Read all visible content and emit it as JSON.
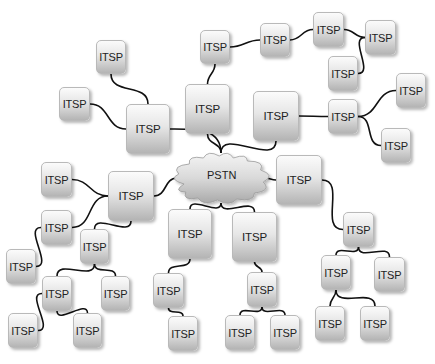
{
  "diagram": {
    "title": "",
    "center": {
      "id": "pstn",
      "label": "PSTN",
      "x": 177,
      "y": 153,
      "w": 88,
      "h": 50
    },
    "nodes": [
      {
        "id": "n1",
        "label": "ITSP",
        "x": 96,
        "y": 40,
        "w": 30,
        "h": 34
      },
      {
        "id": "n2",
        "label": "ITSP",
        "x": 59,
        "y": 87,
        "w": 31,
        "h": 34
      },
      {
        "id": "n3",
        "label": "ITSP",
        "x": 126,
        "y": 104,
        "w": 44,
        "h": 50,
        "size": "large"
      },
      {
        "id": "n4",
        "label": "ITSP",
        "x": 185,
        "y": 84,
        "w": 45,
        "h": 50,
        "size": "large"
      },
      {
        "id": "n5",
        "label": "ITSP",
        "x": 200,
        "y": 30,
        "w": 30,
        "h": 34
      },
      {
        "id": "n6",
        "label": "ITSP",
        "x": 260,
        "y": 23,
        "w": 30,
        "h": 34
      },
      {
        "id": "n7",
        "label": "ITSP",
        "x": 313,
        "y": 12,
        "w": 31,
        "h": 35
      },
      {
        "id": "n8",
        "label": "ITSP",
        "x": 365,
        "y": 20,
        "w": 31,
        "h": 35
      },
      {
        "id": "n9",
        "label": "ITSP",
        "x": 328,
        "y": 56,
        "w": 30,
        "h": 35
      },
      {
        "id": "n10",
        "label": "ITSP",
        "x": 253,
        "y": 91,
        "w": 46,
        "h": 50,
        "size": "large"
      },
      {
        "id": "n11",
        "label": "ITSP",
        "x": 328,
        "y": 99,
        "w": 30,
        "h": 35
      },
      {
        "id": "n12",
        "label": "ITSP",
        "x": 396,
        "y": 73,
        "w": 30,
        "h": 35
      },
      {
        "id": "n13",
        "label": "ITSP",
        "x": 381,
        "y": 128,
        "w": 30,
        "h": 35
      },
      {
        "id": "n14",
        "label": "ITSP",
        "x": 276,
        "y": 155,
        "w": 46,
        "h": 50,
        "size": "large"
      },
      {
        "id": "n15",
        "label": "ITSP",
        "x": 343,
        "y": 212,
        "w": 31,
        "h": 35
      },
      {
        "id": "n16",
        "label": "ITSP",
        "x": 321,
        "y": 255,
        "w": 30,
        "h": 35
      },
      {
        "id": "n17",
        "label": "ITSP",
        "x": 374,
        "y": 257,
        "w": 31,
        "h": 35
      },
      {
        "id": "n18",
        "label": "ITSP",
        "x": 315,
        "y": 306,
        "w": 30,
        "h": 35
      },
      {
        "id": "n19",
        "label": "ITSP",
        "x": 360,
        "y": 306,
        "w": 30,
        "h": 35
      },
      {
        "id": "n20",
        "label": "ITSP",
        "x": 168,
        "y": 209,
        "w": 44,
        "h": 50,
        "size": "large"
      },
      {
        "id": "n21",
        "label": "ITSP",
        "x": 232,
        "y": 212,
        "w": 45,
        "h": 50,
        "size": "large"
      },
      {
        "id": "n22",
        "label": "ITSP",
        "x": 153,
        "y": 273,
        "w": 31,
        "h": 35
      },
      {
        "id": "n23",
        "label": "ITSP",
        "x": 168,
        "y": 316,
        "w": 30,
        "h": 35
      },
      {
        "id": "n24",
        "label": "ITSP",
        "x": 247,
        "y": 272,
        "w": 30,
        "h": 35
      },
      {
        "id": "n25",
        "label": "ITSP",
        "x": 225,
        "y": 315,
        "w": 30,
        "h": 35
      },
      {
        "id": "n26",
        "label": "ITSP",
        "x": 270,
        "y": 315,
        "w": 30,
        "h": 35
      },
      {
        "id": "n27",
        "label": "ITSP",
        "x": 108,
        "y": 171,
        "w": 46,
        "h": 50,
        "size": "large"
      },
      {
        "id": "n28",
        "label": "ITSP",
        "x": 41,
        "y": 162,
        "w": 31,
        "h": 35
      },
      {
        "id": "n29",
        "label": "ITSP",
        "x": 41,
        "y": 210,
        "w": 31,
        "h": 35
      },
      {
        "id": "n30",
        "label": "ITSP",
        "x": 80,
        "y": 229,
        "w": 29,
        "h": 35
      },
      {
        "id": "n31",
        "label": "ITSP",
        "x": 6,
        "y": 249,
        "w": 30,
        "h": 35
      },
      {
        "id": "n32",
        "label": "ITSP",
        "x": 42,
        "y": 276,
        "w": 30,
        "h": 35
      },
      {
        "id": "n33",
        "label": "ITSP",
        "x": 101,
        "y": 276,
        "w": 29,
        "h": 35
      },
      {
        "id": "n34",
        "label": "ITSP",
        "x": 8,
        "y": 313,
        "w": 30,
        "h": 35
      },
      {
        "id": "n35",
        "label": "ITSP",
        "x": 73,
        "y": 313,
        "w": 29,
        "h": 35
      }
    ],
    "edges": [
      [
        "n3",
        "n1"
      ],
      [
        "n3",
        "n2"
      ],
      [
        "n3",
        "pstn"
      ],
      [
        "pstn",
        "n4"
      ],
      [
        "n4",
        "n5"
      ],
      [
        "n5",
        "n6"
      ],
      [
        "n6",
        "n7"
      ],
      [
        "n7",
        "n8"
      ],
      [
        "n8",
        "n9"
      ],
      [
        "pstn",
        "n10"
      ],
      [
        "n10",
        "n11"
      ],
      [
        "n11",
        "n12"
      ],
      [
        "n11",
        "n13"
      ],
      [
        "pstn",
        "n14"
      ],
      [
        "n14",
        "n15"
      ],
      [
        "n15",
        "n16"
      ],
      [
        "n15",
        "n17"
      ],
      [
        "n16",
        "n18"
      ],
      [
        "n16",
        "n19"
      ],
      [
        "pstn",
        "n20"
      ],
      [
        "n20",
        "n22"
      ],
      [
        "n22",
        "n23"
      ],
      [
        "pstn",
        "n21"
      ],
      [
        "n21",
        "n24"
      ],
      [
        "n24",
        "n25"
      ],
      [
        "n24",
        "n26"
      ],
      [
        "pstn",
        "n27"
      ],
      [
        "n27",
        "n28"
      ],
      [
        "n27",
        "n29"
      ],
      [
        "n27",
        "n30"
      ],
      [
        "n29",
        "n31"
      ],
      [
        "n30",
        "n32"
      ],
      [
        "n30",
        "n33"
      ],
      [
        "n32",
        "n34"
      ],
      [
        "n32",
        "n35"
      ]
    ],
    "colors": {
      "line": "#111111",
      "node_border": "#b9b9b9",
      "node_top": "#fbfbfb",
      "node_bottom": "#b4b4b4",
      "cloud_top": "#f4f4f4",
      "cloud_bottom": "#a9a9a9"
    }
  }
}
